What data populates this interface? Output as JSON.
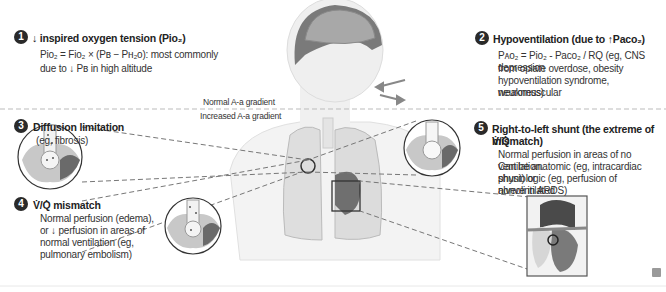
{
  "sections": [
    {
      "number": "1",
      "title": "↓ inspired oxygen tension (Pio₂)",
      "lines": [
        "Pio₂ = Fio₂ × (Pʙ − Pʜ₂o): most commonly",
        "due to ↓ Pʙ in high altitude"
      ]
    },
    {
      "number": "2",
      "title": "Hypoventilation (due to ↑Paco₂)",
      "lines": [
        "Pᴀo₂ = Pio₂ - Paco₂ / RQ (eg, CNS depression",
        "from opiate overdose, obesity",
        "hypoventilation syndrome, neuromuscular",
        "weakness)"
      ]
    },
    {
      "number": "3",
      "title": "Diffusion limitation",
      "lines": [
        "(eg, fibrosis)"
      ]
    },
    {
      "number": "4",
      "title": "V̇/Q̇ mismatch",
      "lines": [
        "Normal perfusion (edema),",
        "or ↓ perfusion in areas of",
        "normal ventilation (eg,",
        "pulmonary embolism)"
      ]
    },
    {
      "number": "5",
      "title": "Right-to-left shunt (the extreme of V̇/Q̇",
      "title2": "mismatch)",
      "lines": [
        "Normal perfusion in areas of no ventilation.",
        "Can be anatomic (eg, intracardiac shunt) or",
        "physiologic (eg, perfusion of nonventilated",
        "alveoli in ARDS)"
      ]
    }
  ],
  "gradient_labels": {
    "normal": "Normal A-a gradient",
    "increased": "Increased A-a gradient"
  },
  "colors": {
    "badge": "#2a2a2a",
    "dash": "#777777",
    "illustration": "#9a9a9a",
    "background": "#ffffff"
  },
  "icons": [
    "brain-icon",
    "airflow-arrow-icon",
    "alveolus-icon",
    "heart-icon",
    "logo-icon"
  ]
}
